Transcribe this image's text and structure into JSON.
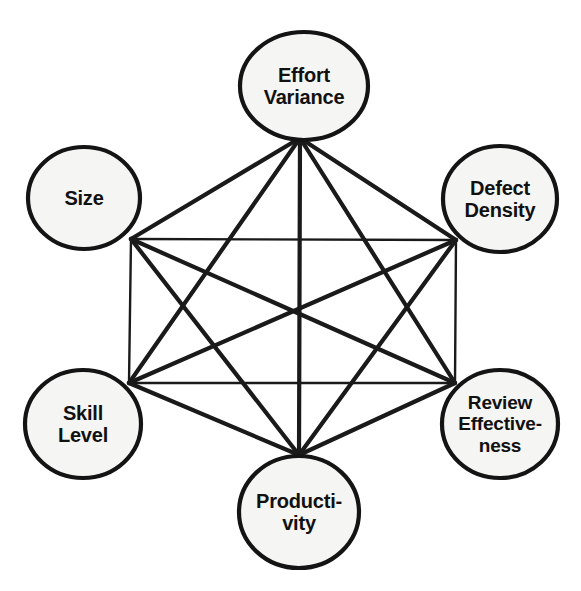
{
  "diagram": {
    "type": "complete-graph",
    "node_count": 6,
    "edge_count": 15,
    "colors": {
      "background": "#ffffff",
      "node_fill": "#f5f5f3",
      "node_stroke": "#141414",
      "edge_stroke": "#1a1a1a",
      "label_text": "#111111"
    },
    "nodes": [
      {
        "id": "effort-variance",
        "label": "Effort\nVariance",
        "position": "top",
        "cx": 304,
        "cy": 86,
        "rx": 64,
        "ry": 54,
        "hub_x": 300,
        "hub_y": 138,
        "font_size": 20
      },
      {
        "id": "size",
        "label": "Size",
        "position": "upper-left",
        "cx": 84,
        "cy": 198,
        "rx": 56,
        "ry": 51,
        "hub_x": 131,
        "hub_y": 239,
        "font_size": 20
      },
      {
        "id": "defect-density",
        "label": "Defect\nDensity",
        "position": "upper-right",
        "cx": 500,
        "cy": 199,
        "rx": 57,
        "ry": 53,
        "hub_x": 456,
        "hub_y": 240,
        "font_size": 20
      },
      {
        "id": "skill-level",
        "label": "Skill\nLevel",
        "position": "lower-left",
        "cx": 83,
        "cy": 424,
        "rx": 58,
        "ry": 54,
        "hub_x": 129,
        "hub_y": 383,
        "font_size": 20
      },
      {
        "id": "review-effectiveness",
        "label": "Review\nEffective-\nness",
        "position": "lower-right",
        "cx": 500,
        "cy": 424,
        "rx": 58,
        "ry": 54,
        "hub_x": 455,
        "hub_y": 383,
        "font_size": 19
      },
      {
        "id": "productivity",
        "label": "Producti-\nvity",
        "position": "bottom",
        "cx": 299,
        "cy": 512,
        "rx": 60,
        "ry": 56,
        "hub_x": 299,
        "hub_y": 455,
        "font_size": 20
      }
    ],
    "edges": [
      {
        "from": "effort-variance",
        "to": "size",
        "style": "diagonal"
      },
      {
        "from": "effort-variance",
        "to": "defect-density",
        "style": "diagonal"
      },
      {
        "from": "effort-variance",
        "to": "skill-level",
        "style": "diagonal"
      },
      {
        "from": "effort-variance",
        "to": "review-effectiveness",
        "style": "diagonal"
      },
      {
        "from": "effort-variance",
        "to": "productivity",
        "style": "diagonal"
      },
      {
        "from": "size",
        "to": "defect-density",
        "style": "straight"
      },
      {
        "from": "size",
        "to": "skill-level",
        "style": "straight"
      },
      {
        "from": "size",
        "to": "review-effectiveness",
        "style": "diagonal"
      },
      {
        "from": "size",
        "to": "productivity",
        "style": "diagonal"
      },
      {
        "from": "defect-density",
        "to": "skill-level",
        "style": "diagonal"
      },
      {
        "from": "defect-density",
        "to": "review-effectiveness",
        "style": "straight"
      },
      {
        "from": "defect-density",
        "to": "productivity",
        "style": "diagonal"
      },
      {
        "from": "skill-level",
        "to": "review-effectiveness",
        "style": "straight"
      },
      {
        "from": "skill-level",
        "to": "productivity",
        "style": "diagonal"
      },
      {
        "from": "review-effectiveness",
        "to": "productivity",
        "style": "diagonal"
      }
    ]
  }
}
